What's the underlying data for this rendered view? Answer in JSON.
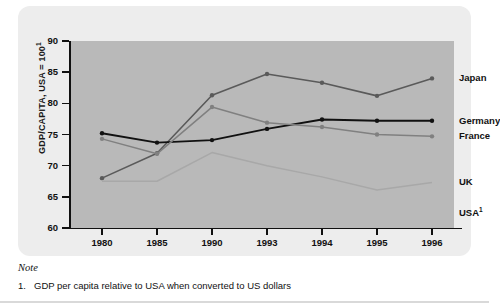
{
  "figure": {
    "ylabel": "GDP/CAPITA, USA = 100",
    "ylabel_sup": "1",
    "note_title": "Note",
    "note_number": "1.",
    "note_text": "GDP per capita relative to USA when converted to US dollars"
  },
  "colors": {
    "plot_background": "#b9b9b9",
    "card_background": "#ededed",
    "japan": "#5a5a5a",
    "germany": "#111111",
    "france": "#808080",
    "uk": "#a8a8a8",
    "axis": "#111111"
  },
  "chart_data": {
    "type": "line",
    "title": "",
    "xlabel": "",
    "ylabel": "GDP/CAPITA, USA = 100",
    "categories": [
      "1980",
      "1985",
      "1990",
      "1993",
      "1994",
      "1995",
      "1996"
    ],
    "ylim": [
      60,
      90
    ],
    "yticks": [
      60,
      65,
      70,
      75,
      80,
      85,
      90
    ],
    "grid": false,
    "legend_position": "right",
    "series": [
      {
        "name": "Japan",
        "values": [
          68.0,
          72.0,
          81.3,
          84.7,
          83.3,
          81.2,
          84.0
        ]
      },
      {
        "name": "Germany",
        "values": [
          75.2,
          73.7,
          74.1,
          75.9,
          77.4,
          77.2,
          77.2
        ]
      },
      {
        "name": "France",
        "values": [
          74.3,
          71.9,
          79.4,
          76.9,
          76.2,
          75.0,
          74.7
        ]
      },
      {
        "name": "UK",
        "values": [
          67.5,
          67.5,
          72.1,
          70.0,
          68.2,
          66.1,
          67.3
        ]
      },
      {
        "name": "USA",
        "values": [
          100,
          100,
          100,
          100,
          100,
          100,
          100
        ],
        "legend_only": true,
        "legend_sup": "1"
      }
    ],
    "legend_entries": [
      {
        "label": "Japan",
        "sup": "",
        "value_at_end": 84.0
      },
      {
        "label": "Germany",
        "sup": "",
        "value_at_end": 77.2
      },
      {
        "label": "France",
        "sup": "",
        "value_at_end": 74.7
      },
      {
        "label": "UK",
        "sup": "",
        "value_at_end": 67.3
      },
      {
        "label": "USA",
        "sup": "1",
        "value_at_end": 62.5
      }
    ]
  }
}
